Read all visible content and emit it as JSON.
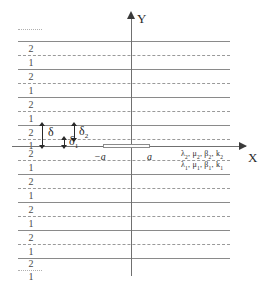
{
  "figure": {
    "kind": "periodic-layered-medium-crack-diagram",
    "width": 272,
    "height": 284,
    "background": "#ffffff"
  },
  "axes": {
    "y_label": "Y",
    "x_label": "X",
    "origin_x": 131,
    "origin_y": 146,
    "line_color": "#707070",
    "arrow_color": "#3a3a3a"
  },
  "interfaces": {
    "solid_color": "#8a8a8a",
    "dashed_color": "#9a9a9a",
    "dotted_color": "#b0b0b0",
    "lines": [
      {
        "y": 29,
        "style": "dotted",
        "x": 18,
        "width": 24
      },
      {
        "y": 41,
        "style": "solid",
        "x": 18,
        "width": 212
      },
      {
        "y": 55,
        "style": "dashed",
        "x": 18,
        "width": 212
      },
      {
        "y": 69,
        "style": "solid",
        "x": 18,
        "width": 212
      },
      {
        "y": 83,
        "style": "dashed",
        "x": 18,
        "width": 212
      },
      {
        "y": 97,
        "style": "solid",
        "x": 18,
        "width": 212
      },
      {
        "y": 111,
        "style": "dashed",
        "x": 18,
        "width": 212
      },
      {
        "y": 125,
        "style": "solid",
        "x": 18,
        "width": 212
      },
      {
        "y": 139,
        "style": "dashed",
        "x": 18,
        "width": 212
      },
      {
        "y": 160,
        "style": "dashed",
        "x": 18,
        "width": 212
      },
      {
        "y": 174,
        "style": "solid",
        "x": 18,
        "width": 212
      },
      {
        "y": 188,
        "style": "dashed",
        "x": 18,
        "width": 212
      },
      {
        "y": 202,
        "style": "solid",
        "x": 18,
        "width": 212
      },
      {
        "y": 216,
        "style": "dashed",
        "x": 18,
        "width": 212
      },
      {
        "y": 230,
        "style": "solid",
        "x": 18,
        "width": 212
      },
      {
        "y": 244,
        "style": "dashed",
        "x": 18,
        "width": 212
      },
      {
        "y": 258,
        "style": "solid",
        "x": 18,
        "width": 212
      },
      {
        "y": 270,
        "style": "dotted",
        "x": 18,
        "width": 24
      }
    ]
  },
  "layer_numbers": [
    {
      "label": "2",
      "x": 26,
      "y": 44
    },
    {
      "label": "1",
      "x": 26,
      "y": 58
    },
    {
      "label": "2",
      "x": 26,
      "y": 72
    },
    {
      "label": "1",
      "x": 26,
      "y": 86
    },
    {
      "label": "2",
      "x": 26,
      "y": 100
    },
    {
      "label": "1",
      "x": 26,
      "y": 114
    },
    {
      "label": "2",
      "x": 26,
      "y": 128
    },
    {
      "label": "1",
      "x": 26,
      "y": 141
    },
    {
      "label": "2",
      "x": 26,
      "y": 149
    },
    {
      "label": "1",
      "x": 26,
      "y": 163
    },
    {
      "label": "2",
      "x": 26,
      "y": 177
    },
    {
      "label": "1",
      "x": 26,
      "y": 191
    },
    {
      "label": "2",
      "x": 26,
      "y": 205
    },
    {
      "label": "1",
      "x": 26,
      "y": 219
    },
    {
      "label": "2",
      "x": 26,
      "y": 233
    },
    {
      "label": "1",
      "x": 26,
      "y": 247
    },
    {
      "label": "2",
      "x": 26,
      "y": 259
    },
    {
      "label": "1",
      "x": 26,
      "y": 272
    }
  ],
  "crack": {
    "left_label": "−a",
    "right_label": "a",
    "rect_left": 103,
    "rect_right": 150,
    "rect_top": 144,
    "rect_height": 4
  },
  "dimensions": {
    "delta": {
      "symbol": "δ",
      "subscript": "",
      "meaning": "full period thickness",
      "top": 125,
      "bottom": 146,
      "line_x": 42,
      "label_x": 48,
      "label_y": 126
    },
    "delta2": {
      "symbol": "δ",
      "subscript": "2",
      "meaning": "upper sublayer thickness",
      "top": 125,
      "bottom": 139,
      "line_x": 74,
      "label_x": 79,
      "label_y": 126
    },
    "delta1": {
      "symbol": "δ",
      "subscript": "1",
      "meaning": "lower sublayer thickness",
      "top": 139,
      "bottom": 146,
      "line_x": 64,
      "label_x": 69,
      "label_y": 136
    }
  },
  "material_labels": {
    "upper": {
      "parts": [
        {
          "symbol": "λ",
          "subscript": "2"
        },
        {
          "symbol": "μ",
          "subscript": "2"
        },
        {
          "symbol": "β",
          "subscript": "2"
        },
        {
          "symbol": "k",
          "subscript": "2"
        }
      ],
      "text": "λ₂, μ₂, β₂, k₂",
      "x": 181,
      "y": 150
    },
    "lower": {
      "parts": [
        {
          "symbol": "λ",
          "subscript": "1"
        },
        {
          "symbol": "μ",
          "subscript": "1"
        },
        {
          "symbol": "β",
          "subscript": "1"
        },
        {
          "symbol": "k",
          "subscript": "1"
        }
      ],
      "text": "λ₁, μ₁, β₁, k₁",
      "x": 181,
      "y": 161
    }
  }
}
